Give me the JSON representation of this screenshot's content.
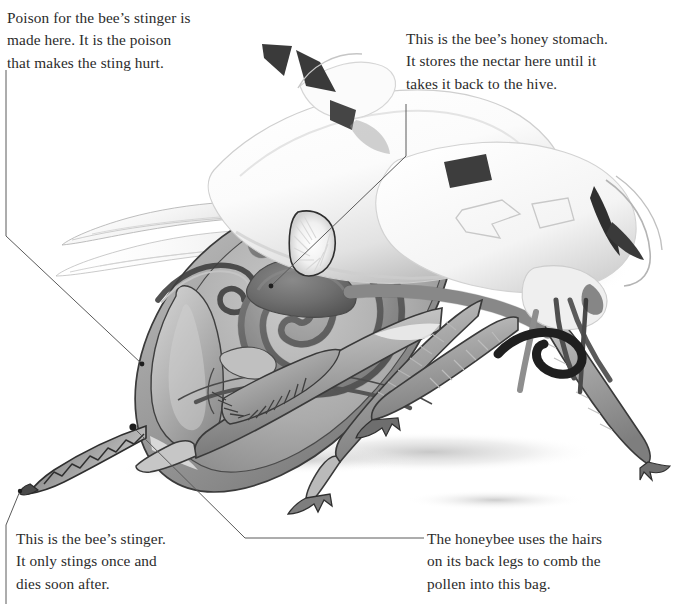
{
  "figure": {
    "background_color": "#ffffff",
    "ink_color": "#2b2b2b",
    "leader_line_color": "#5a5a5a"
  },
  "captions": {
    "poison_gland": {
      "text": "Poison for the bee’s stinger is\nmade here. It is the poison\nthat makes the sting hurt.",
      "target_label": "poison-sac"
    },
    "honey_stomach": {
      "text": "This is the bee’s honey stomach.\nIt stores the nectar here until it\ntakes it back to the hive.",
      "target_label": "honey-stomach"
    },
    "stinger": {
      "text": "This is the bee’s stinger.\nIt only stings once and\ndies soon after.",
      "target_label": "stinger-tip"
    },
    "pollen_basket": {
      "text": "The honeybee uses the hairs\non its back legs to comb the\npollen into this bag.",
      "target_label": "pollen-basket"
    }
  },
  "leaders": [
    {
      "name": "leader-poison-gland",
      "points": "6,70 6,236 142,364"
    },
    {
      "name": "leader-honey-stomach",
      "points": "406,104 406,156 271,286"
    },
    {
      "name": "leader-stinger",
      "points": "6,604 6,525 20,491"
    },
    {
      "name": "leader-pollen-basket",
      "points": "133,427 245,538 424,538"
    }
  ],
  "markers": [
    {
      "name": "marker-poison-sac",
      "x": 142,
      "y": 364
    },
    {
      "name": "marker-honey-stomach",
      "x": 271,
      "y": 286
    },
    {
      "name": "marker-pollen-basket",
      "x": 133,
      "y": 427
    },
    {
      "name": "marker-stinger-tip",
      "x": 20,
      "y": 491
    }
  ],
  "anatomy_parts": [
    "forewing",
    "hindwing",
    "thorax",
    "head",
    "antenna",
    "compound-eye",
    "proboscis",
    "foreleg",
    "middle-leg",
    "hind-leg",
    "pollen-basket",
    "abdomen",
    "honey-stomach",
    "intestine-coil",
    "poison-sac",
    "stinger"
  ]
}
